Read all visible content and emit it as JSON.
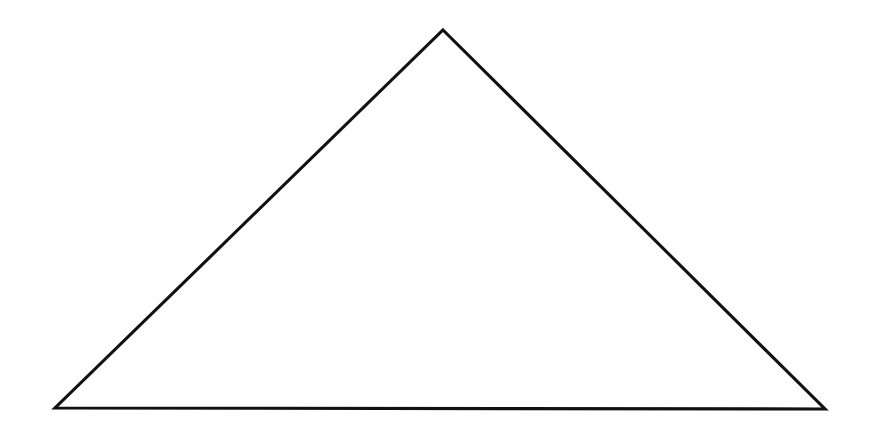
{
  "page": {
    "width": 874,
    "height": 447,
    "background_color": "#ffffff",
    "content_description": "A single large black outline triangle drawn on a plain white background"
  },
  "figure": {
    "name": "triangle",
    "shape_type": "triangle",
    "classification": "isosceles-ish acute triangle",
    "fill": "none",
    "stroke_color": "#111111",
    "stroke_width_px": 3,
    "style": "hand-drawn outline, slightly irregular edges",
    "vertices": [
      {
        "label": "apex",
        "x": 443,
        "y": 30
      },
      {
        "label": "bottom-right",
        "x": 825,
        "y": 409
      },
      {
        "label": "bottom-left",
        "x": 55,
        "y": 408
      }
    ],
    "points_attr": "443,30 825,409 55,408",
    "edges": [
      {
        "label": "left-leg",
        "from": "bottom-left",
        "to": "apex"
      },
      {
        "label": "right-leg",
        "from": "apex",
        "to": "bottom-right"
      },
      {
        "label": "base",
        "from": "bottom-left",
        "to": "bottom-right"
      }
    ],
    "measurements": {
      "base_width_px": 770,
      "height_px": 379,
      "apex_offset_from_left_px": 388,
      "apex_offset_from_right_px": 382
    }
  },
  "labels": {
    "none_present": ""
  }
}
